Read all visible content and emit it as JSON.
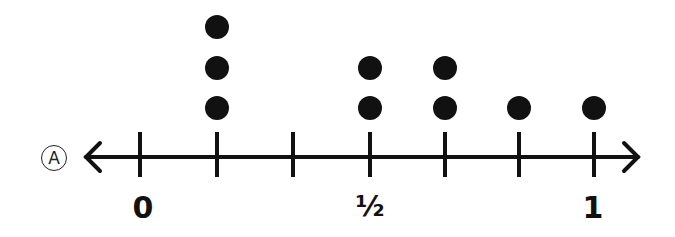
{
  "option_label": "A",
  "chart_data": {
    "type": "scatter",
    "subtype": "dot-plot",
    "title": "",
    "xlabel": "",
    "ylabel": "",
    "x": [
      0.125,
      0.5,
      0.625,
      0.75,
      0.875,
      1.0
    ],
    "tick_positions": [
      0,
      0.125,
      0.25,
      0.375,
      0.5,
      0.625,
      0.75,
      0.875,
      1
    ],
    "visible_ticks": [
      0,
      0.125,
      0.25,
      0.5,
      0.625,
      0.75,
      1
    ],
    "tick_labels": [
      {
        "value": 0,
        "label": "0"
      },
      {
        "value": 0.5,
        "label": "½"
      },
      {
        "value": 1,
        "label": "1"
      }
    ],
    "counts": [
      {
        "x": 0.125,
        "count": 3
      },
      {
        "x": 0.5,
        "count": 2
      },
      {
        "x": 0.625,
        "count": 2
      },
      {
        "x": 0.75,
        "count": 1
      },
      {
        "x": 1.0,
        "count": 1
      }
    ],
    "dot_columns": [
      {
        "tick_index": 1,
        "count": 3
      },
      {
        "tick_index": 3,
        "count": 2
      },
      {
        "tick_index": 4,
        "count": 2
      },
      {
        "tick_index": 5,
        "count": 1
      },
      {
        "tick_index": 6,
        "count": 1
      }
    ],
    "xlim": [
      0,
      1
    ],
    "grid": false,
    "legend": null
  },
  "labels": {
    "zero": "0",
    "half": "½",
    "one": "1"
  }
}
